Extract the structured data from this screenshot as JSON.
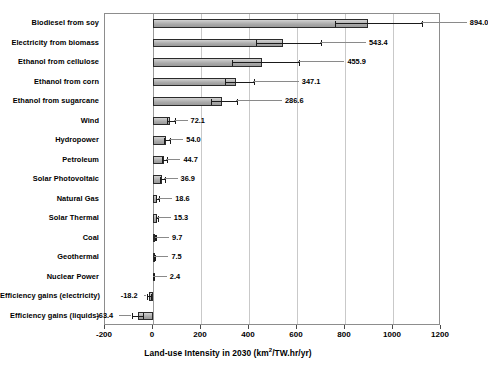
{
  "chart_data": {
    "type": "bar",
    "orientation": "horizontal",
    "title": "",
    "xlabel": "Land-use Intensity in 2030 (km²/TW.hr/yr)",
    "xlabel_parts": {
      "before": "Land-use Intensity in 2030 (km",
      "sup": "2",
      "after": "/TW.hr/yr)"
    },
    "ylabel": "",
    "xlim": [
      -200,
      1200
    ],
    "xticks": [
      -200,
      0,
      200,
      400,
      600,
      800,
      1000,
      1200
    ],
    "xtick_labels": [
      "-200",
      "0",
      "200",
      "400",
      "600",
      "800",
      "1000",
      "1200"
    ],
    "grid": "vertical",
    "legend": "none",
    "categories": [
      "Biodiesel from soy",
      "Electricity from biomass",
      "Ethanol from cellulose",
      "Ethanol from corn",
      "Ethanol from sugarcane",
      "Wind",
      "Hydropower",
      "Petroleum",
      "Solar Photovoltaic",
      "Natural Gas",
      "Solar Thermal",
      "Coal",
      "Geothermal",
      "Nuclear Power",
      "Efficiency gains (electricity)",
      "Efficiency gains (liquids)"
    ],
    "values": [
      894.0,
      543.4,
      455.9,
      347.1,
      286.6,
      72.1,
      54.0,
      44.7,
      36.9,
      18.6,
      15.3,
      9.7,
      7.5,
      2.4,
      -18.2,
      -63.4
    ],
    "value_labels": [
      "894.0",
      "543.4",
      "455.9",
      "347.1",
      "286.6",
      "72.1",
      "54.0",
      "44.7",
      "36.9",
      "18.6",
      "15.3",
      "9.7",
      "7.5",
      "2.4",
      "-18.2",
      "-63.4"
    ],
    "error_high": [
      1120.0,
      700.0,
      610.0,
      420.0,
      350.0,
      90.0,
      72.0,
      60.0,
      48.0,
      26.0,
      20.0,
      13.0,
      10.0,
      3.5,
      -10.0,
      -40.0
    ],
    "error_low": [
      760.0,
      430.0,
      330.0,
      300.0,
      240.0,
      60.0,
      44.0,
      36.0,
      30.0,
      13.0,
      11.0,
      7.0,
      5.5,
      1.5,
      -26.0,
      -86.0
    ],
    "bar_color": "#b4b4b4",
    "bar_edge_color": "#2b2b2b",
    "grid_color": "#c9c9c9",
    "axis_color": "#8d8d8d"
  }
}
